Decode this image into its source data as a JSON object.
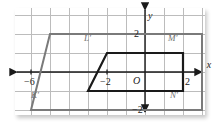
{
  "figure": {
    "type": "coordinate-grid-transformation",
    "panel": {
      "x": 15,
      "y": 8,
      "width": 190,
      "height": 107
    },
    "grid": {
      "cell_px": 19,
      "color": "#bcbcbc",
      "origin_px": {
        "x": 130,
        "y": 64
      },
      "x_range": [
        -7,
        3
      ],
      "y_range": [
        -3,
        3
      ]
    },
    "axes": {
      "x_label": "x",
      "y_label": "y",
      "origin_label": "O",
      "color": "#1a1a1a",
      "x_ticks": [
        {
          "label": "−6",
          "value": -6
        },
        {
          "label": "−2",
          "value": -2
        },
        {
          "label": "2",
          "value": 2
        }
      ],
      "y_ticks": [
        {
          "label": "2",
          "value": 2
        },
        {
          "label": "−2",
          "value": -2
        }
      ]
    },
    "shapes": [
      {
        "name": "preimage-parallelogram",
        "color": "#1a1a1a",
        "stroke_width": 2.2,
        "vertices_units": [
          [
            -3,
            -1
          ],
          [
            -2,
            1
          ],
          [
            2,
            1
          ],
          [
            2,
            -1
          ]
        ],
        "closed": true
      },
      {
        "name": "image-parallelogram",
        "color": "#7a7a7a",
        "stroke_width": 2.0,
        "vertices_units": [
          [
            -6,
            -2
          ],
          [
            -5,
            2
          ],
          [
            3,
            2
          ],
          [
            3,
            -2
          ]
        ],
        "closed": true
      }
    ],
    "vertex_labels": [
      {
        "key": "L",
        "label": "L′",
        "x": 84,
        "y": 34
      },
      {
        "key": "M",
        "label": "M′",
        "x": 168,
        "y": 34
      },
      {
        "key": "K",
        "label": "K′",
        "x": 31,
        "y": 91
      },
      {
        "key": "N",
        "label": "N′",
        "x": 170,
        "y": 91
      }
    ]
  }
}
